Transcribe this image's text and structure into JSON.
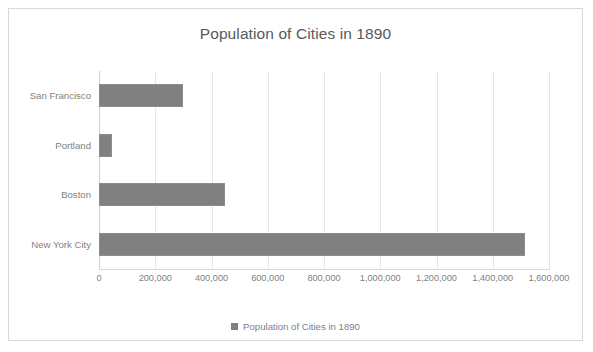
{
  "chart_data": {
    "type": "bar",
    "orientation": "horizontal",
    "title": "Population of Cities in 1890",
    "categories": [
      "San Francisco",
      "Portland",
      "Boston",
      "New York City"
    ],
    "values": [
      300000,
      46000,
      448000,
      1515000
    ],
    "series": [
      {
        "name": "Population of Cities in 1890",
        "values": [
          300000,
          46000,
          448000,
          1515000
        ]
      }
    ],
    "xlabel": "",
    "ylabel": "",
    "xlim": [
      0,
      1600000
    ],
    "xticks": [
      0,
      200000,
      400000,
      600000,
      800000,
      1000000,
      1200000,
      1400000,
      1600000
    ],
    "xtick_labels": [
      "0",
      "200,000",
      "400,000",
      "600,000",
      "800,000",
      "1,000,000",
      "1,200,000",
      "1,400,000",
      "1,600,000"
    ],
    "grid": true,
    "grid_axis": "x",
    "legend": {
      "position": "bottom",
      "entries": [
        "Population of Cities in 1890"
      ]
    },
    "colors": {
      "bar": "#808080",
      "bar_border": "#8c8c8c",
      "gridline": "#e6e6e6",
      "axis": "#d9d9d9",
      "text": "#7f7f7f",
      "title_text": "#595959",
      "frame_border": "#d9d9d9",
      "background": "#ffffff"
    }
  }
}
